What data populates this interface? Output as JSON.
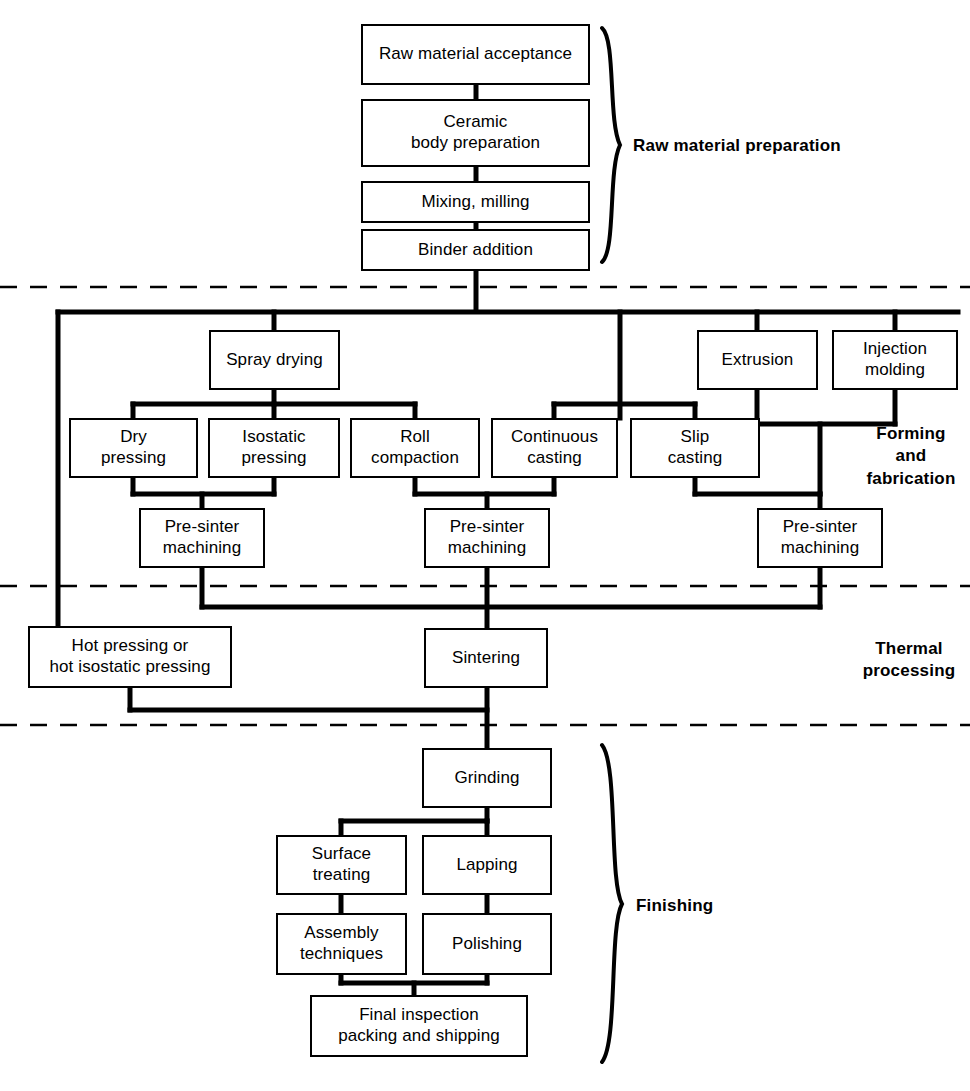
{
  "diagram": {
    "line_color": "#000000",
    "background_color": "#ffffff",
    "sections": [
      {
        "id": "raw",
        "label": "Raw material preparation"
      },
      {
        "id": "forming",
        "label": "Forming\nand\nfabrication",
        "lines": [
          "Forming",
          "and",
          "fabrication"
        ]
      },
      {
        "id": "thermal",
        "label": "Thermal\nprocessing",
        "lines": [
          "Thermal",
          "processing"
        ]
      },
      {
        "id": "finishing",
        "label": "Finishing",
        "lines": [
          "Finishing"
        ]
      }
    ],
    "section_labels": {
      "raw": "Raw material preparation",
      "forming_line1": "Forming",
      "forming_line2": "and",
      "forming_line3": "fabrication",
      "thermal_line1": "Thermal",
      "thermal_line2": "processing",
      "finishing": "Finishing"
    },
    "nodes": [
      {
        "id": "raw-material-acceptance",
        "lines": [
          "Raw material acceptance"
        ],
        "x": 361,
        "y": 24,
        "w": 229,
        "h": 61,
        "section": "raw"
      },
      {
        "id": "ceramic-body-preparation",
        "lines": [
          "Ceramic",
          "body preparation"
        ],
        "x": 361,
        "y": 99,
        "w": 229,
        "h": 68,
        "section": "raw"
      },
      {
        "id": "mixing-milling",
        "lines": [
          "Mixing, milling"
        ],
        "x": 361,
        "y": 181,
        "w": 229,
        "h": 42,
        "section": "raw"
      },
      {
        "id": "binder-addition",
        "lines": [
          "Binder addition"
        ],
        "x": 361,
        "y": 229,
        "w": 229,
        "h": 42,
        "section": "raw"
      },
      {
        "id": "spray-drying",
        "lines": [
          "Spray drying"
        ],
        "x": 209,
        "y": 330,
        "w": 131,
        "h": 60,
        "section": "forming"
      },
      {
        "id": "extrusion",
        "lines": [
          "Extrusion"
        ],
        "x": 697,
        "y": 330,
        "w": 121,
        "h": 60,
        "section": "forming"
      },
      {
        "id": "injection-molding",
        "lines": [
          "Injection",
          "molding"
        ],
        "x": 832,
        "y": 330,
        "w": 126,
        "h": 60,
        "section": "forming"
      },
      {
        "id": "dry-pressing",
        "lines": [
          "Dry",
          "pressing"
        ],
        "x": 69,
        "y": 418,
        "w": 129,
        "h": 60,
        "section": "forming"
      },
      {
        "id": "isostatic-pressing",
        "lines": [
          "Isostatic",
          "pressing"
        ],
        "x": 208,
        "y": 418,
        "w": 132,
        "h": 60,
        "section": "forming"
      },
      {
        "id": "roll-compaction",
        "lines": [
          "Roll",
          "compaction"
        ],
        "x": 350,
        "y": 418,
        "w": 130,
        "h": 60,
        "section": "forming"
      },
      {
        "id": "continuous-casting",
        "lines": [
          "Continuous",
          "casting"
        ],
        "x": 491,
        "y": 418,
        "w": 127,
        "h": 60,
        "section": "forming"
      },
      {
        "id": "slip-casting",
        "lines": [
          "Slip",
          "casting"
        ],
        "x": 630,
        "y": 418,
        "w": 130,
        "h": 60,
        "section": "forming"
      },
      {
        "id": "pre-sinter-machining-1",
        "lines": [
          "Pre-sinter",
          "machining"
        ],
        "x": 139,
        "y": 508,
        "w": 126,
        "h": 60,
        "section": "forming"
      },
      {
        "id": "pre-sinter-machining-2",
        "lines": [
          "Pre-sinter",
          "machining"
        ],
        "x": 424,
        "y": 508,
        "w": 126,
        "h": 60,
        "section": "forming"
      },
      {
        "id": "pre-sinter-machining-3",
        "lines": [
          "Pre-sinter",
          "machining"
        ],
        "x": 757,
        "y": 508,
        "w": 126,
        "h": 60,
        "section": "forming"
      },
      {
        "id": "hot-pressing",
        "lines": [
          "Hot pressing or",
          "hot isostatic pressing"
        ],
        "x": 28,
        "y": 626,
        "w": 204,
        "h": 62,
        "section": "thermal"
      },
      {
        "id": "sintering",
        "lines": [
          "Sintering"
        ],
        "x": 424,
        "y": 628,
        "w": 124,
        "h": 60,
        "section": "thermal"
      },
      {
        "id": "grinding",
        "lines": [
          "Grinding"
        ],
        "x": 422,
        "y": 748,
        "w": 130,
        "h": 60,
        "section": "finishing"
      },
      {
        "id": "surface-treating",
        "lines": [
          "Surface",
          "treating"
        ],
        "x": 276,
        "y": 835,
        "w": 131,
        "h": 60,
        "section": "finishing"
      },
      {
        "id": "lapping",
        "lines": [
          "Lapping"
        ],
        "x": 422,
        "y": 835,
        "w": 130,
        "h": 60,
        "section": "finishing"
      },
      {
        "id": "assembly-techniques",
        "lines": [
          "Assembly",
          "techniques"
        ],
        "x": 276,
        "y": 913,
        "w": 131,
        "h": 62,
        "section": "finishing"
      },
      {
        "id": "polishing",
        "lines": [
          "Polishing"
        ],
        "x": 422,
        "y": 913,
        "w": 130,
        "h": 62,
        "section": "finishing"
      },
      {
        "id": "final-inspection",
        "lines": [
          "Final inspection",
          "packing and shipping"
        ],
        "x": 310,
        "y": 995,
        "w": 218,
        "h": 62,
        "section": "finishing"
      }
    ],
    "divider_lines": [
      {
        "id": "divider-raw-forming",
        "y": 287
      },
      {
        "id": "divider-forming-thermal",
        "y": 586
      },
      {
        "id": "divider-thermal-finishing",
        "y": 725
      }
    ],
    "flow": {
      "main_axis_x": 476,
      "left_bypass_x": 58,
      "forming_bus_y": 312,
      "forming_collect_y": 607,
      "thermal_collect_y": 710
    }
  }
}
